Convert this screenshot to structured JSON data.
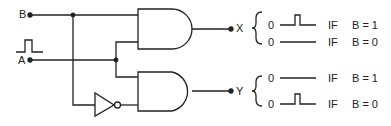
{
  "inputs": {
    "b": {
      "label": "B"
    },
    "a": {
      "label": "A"
    }
  },
  "outputs": {
    "x": {
      "label": "X"
    },
    "y": {
      "label": "Y"
    }
  },
  "gates": [
    {
      "type": "AND",
      "name": "upper-and-gate"
    },
    {
      "type": "AND",
      "name": "lower-and-gate"
    },
    {
      "type": "NOT",
      "name": "inverter"
    }
  ],
  "truth": {
    "x": [
      {
        "level": "0",
        "waveform": "pulse",
        "cond_if": "IF",
        "cond": "B = 1"
      },
      {
        "level": "0",
        "waveform": "flat",
        "cond_if": "IF",
        "cond": "B = 0"
      }
    ],
    "y": [
      {
        "level": "0",
        "waveform": "flat",
        "cond_if": "IF",
        "cond": "B = 1"
      },
      {
        "level": "0",
        "waveform": "pulse",
        "cond_if": "IF",
        "cond": "B = 0"
      }
    ]
  },
  "colors": {
    "line": "#222222",
    "background": "#ffffff"
  }
}
